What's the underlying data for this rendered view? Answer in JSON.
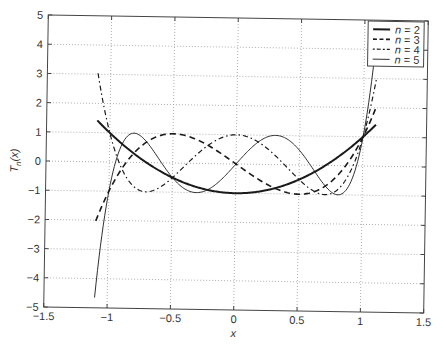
{
  "chart_data": {
    "type": "line",
    "title": "",
    "xlabel": "x",
    "ylabel": "T_n(x)",
    "xlim": [
      -1.5,
      1.5
    ],
    "ylim": [
      -5,
      5
    ],
    "xticks": [
      -1.5,
      -1,
      -0.5,
      0,
      0.5,
      1,
      1.5
    ],
    "xtick_labels": [
      "−1.5",
      "−1",
      "−0.5",
      "0",
      "0.5",
      "1",
      "1.5"
    ],
    "yticks": [
      -5,
      -4,
      -3,
      -2,
      -1,
      0,
      1,
      2,
      3,
      4,
      5
    ],
    "ytick_labels": [
      "−5",
      "−4",
      "−3",
      "−2",
      "−1",
      "0",
      "1",
      "2",
      "3",
      "4",
      "5"
    ],
    "grid": true,
    "legend_position": "upper right",
    "x_domain": [
      -1.1,
      1.1
    ],
    "series": [
      {
        "name": "n = 2",
        "n": 2,
        "style": "solid-thick",
        "formula": "2x^2 - 1",
        "x": [
          -1.1,
          -1,
          -0.5,
          0,
          0.5,
          1,
          1.1
        ],
        "values": [
          1.42,
          1,
          -0.5,
          -1,
          -0.5,
          1,
          1.42
        ]
      },
      {
        "name": "n = 3",
        "n": 3,
        "style": "dashed",
        "formula": "4x^3 - 3x",
        "x": [
          -1.1,
          -1,
          -0.5,
          0,
          0.5,
          1,
          1.1
        ],
        "values": [
          -2.02,
          -1,
          1,
          0,
          -1,
          1,
          2.02
        ]
      },
      {
        "name": "n = 4",
        "n": 4,
        "style": "dash-dot",
        "formula": "8x^4 - 8x^2 + 1",
        "x": [
          -1.1,
          -1,
          -0.5,
          0,
          0.5,
          1,
          1.1
        ],
        "values": [
          3.03,
          1,
          -0.5,
          1,
          -0.5,
          1,
          3.03
        ]
      },
      {
        "name": "n = 5",
        "n": 5,
        "style": "solid-thin",
        "formula": "16x^5 - 20x^3 + 5x",
        "x": [
          -1.1,
          -1,
          -0.5,
          0,
          0.5,
          1,
          1.1
        ],
        "values": [
          -4.65,
          -1,
          -0.5,
          0,
          0.5,
          1,
          4.65
        ]
      }
    ]
  },
  "legend": {
    "items": [
      {
        "label_var": "n",
        "label_rest": " = 2"
      },
      {
        "label_var": "n",
        "label_rest": " = 3"
      },
      {
        "label_var": "n",
        "label_rest": " = 4"
      },
      {
        "label_var": "n",
        "label_rest": " = 5"
      }
    ]
  },
  "axes": {
    "xlabel": "x",
    "ylabel_main": "T",
    "ylabel_sub": "n",
    "ylabel_arg": "(x)"
  },
  "colors": {
    "line": "#1a1a1a",
    "grid": "#9a9a9a",
    "axis": "#444444"
  }
}
